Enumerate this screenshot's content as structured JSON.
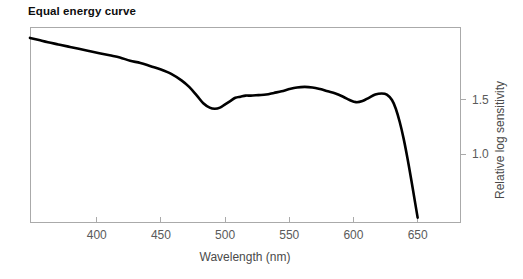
{
  "chart_data": {
    "type": "line",
    "title": "Equal energy curve",
    "xlabel": "Wavelength (nm)",
    "ylabel": "Relative log sensitivity",
    "xlim": [
      348,
      683
    ],
    "ylim": [
      0.38,
      2.17
    ],
    "xticks": [
      400,
      450,
      500,
      550,
      600,
      650
    ],
    "xticklabels": [
      "400",
      "450",
      "500",
      "550",
      "600",
      "650"
    ],
    "yticks": [
      1.0,
      1.5
    ],
    "yticklabels": [
      "1.0",
      "1.5"
    ],
    "grid": false,
    "legend": null,
    "series": [
      {
        "name": "Equal energy curve",
        "color": "#000000",
        "linewidth": 2.6,
        "x": [
          348,
          355,
          362,
          370,
          378,
          386,
          394,
          402,
          410,
          418,
          426,
          434,
          442,
          450,
          458,
          466,
          472,
          478,
          483,
          488,
          492,
          496,
          500,
          504,
          508,
          512,
          516,
          520,
          526,
          532,
          538,
          544,
          550,
          556,
          562,
          568,
          574,
          580,
          586,
          592,
          597,
          602,
          607,
          612,
          617,
          622,
          626,
          630,
          633,
          636,
          639,
          642,
          645,
          648,
          650
        ],
        "y": [
          2.07,
          2.05,
          2.03,
          2.01,
          1.99,
          1.97,
          1.95,
          1.93,
          1.91,
          1.89,
          1.86,
          1.84,
          1.81,
          1.78,
          1.74,
          1.68,
          1.62,
          1.54,
          1.47,
          1.43,
          1.42,
          1.43,
          1.46,
          1.49,
          1.52,
          1.53,
          1.54,
          1.54,
          1.545,
          1.55,
          1.565,
          1.58,
          1.6,
          1.615,
          1.62,
          1.615,
          1.6,
          1.58,
          1.56,
          1.53,
          1.5,
          1.48,
          1.49,
          1.52,
          1.55,
          1.56,
          1.55,
          1.5,
          1.42,
          1.3,
          1.15,
          0.97,
          0.77,
          0.56,
          0.42
        ]
      }
    ],
    "axis_color": "#aaaaaa",
    "tick_color": "#aaaaaa",
    "label_color": "#5a5a5a",
    "title_color": "#0d0d0d",
    "background": "#ffffff"
  }
}
